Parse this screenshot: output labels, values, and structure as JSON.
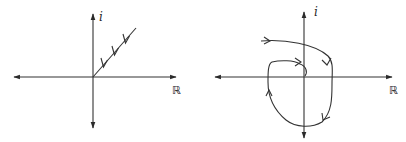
{
  "figure": {
    "panels": [
      {
        "id": "left",
        "title": "Ray contour approaching origin",
        "axis_labels": {
          "imaginary": "i",
          "real": "ℝ"
        },
        "curve": "straight ray from upper-right into the origin with three arrows pointing toward the origin"
      },
      {
        "id": "right",
        "title": "Spiral contour winding into origin",
        "axis_labels": {
          "imaginary": "i",
          "real": "ℝ"
        },
        "curve": "curve entering from upper-left, sweeping clockwise around the origin and spiraling into it"
      }
    ],
    "colors": {
      "stroke": "#333333",
      "background": "#ffffff"
    }
  }
}
